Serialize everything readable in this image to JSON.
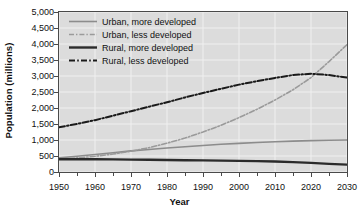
{
  "chart_data": {
    "type": "line",
    "title": "",
    "xlabel": "Year",
    "ylabel": "Population (millions)",
    "xlim": [
      1950,
      2030
    ],
    "ylim": [
      0,
      5000
    ],
    "ytick_step": 500,
    "xtick_step": 10,
    "xminor_step": 5,
    "grid": true,
    "legend_position": "top-left",
    "xticks": [
      "1950",
      "1960",
      "1970",
      "1980",
      "1990",
      "2000",
      "2010",
      "2020",
      "2030"
    ],
    "yticks": [
      "0",
      "500",
      "1,000",
      "1,500",
      "2,000",
      "2,500",
      "3,000",
      "3,500",
      "4,000",
      "4,500",
      "5,000"
    ],
    "x": [
      1950,
      1955,
      1960,
      1965,
      1970,
      1975,
      1980,
      1985,
      1990,
      1995,
      2000,
      2005,
      2010,
      2015,
      2020,
      2025,
      2030
    ],
    "series": [
      {
        "name": "Urban, more developed",
        "style": "solid",
        "color": "#8c8c8c",
        "width": 1.6,
        "values": [
          440,
          490,
          545,
          600,
          660,
          705,
          750,
          790,
          830,
          865,
          895,
          920,
          945,
          965,
          980,
          992,
          1000
        ]
      },
      {
        "name": "Urban, less developed",
        "style": "dashdot",
        "color": "#9a9a9a",
        "width": 1.6,
        "values": [
          400,
          440,
          490,
          560,
          650,
          760,
          900,
          1060,
          1250,
          1460,
          1700,
          1960,
          2250,
          2570,
          2950,
          3450,
          3980
        ]
      },
      {
        "name": "Rural, more developed",
        "style": "solid",
        "color": "#2b2b2b",
        "width": 2.4,
        "values": [
          400,
          400,
          398,
          393,
          388,
          382,
          375,
          368,
          362,
          355,
          348,
          340,
          330,
          310,
          285,
          255,
          230
        ]
      },
      {
        "name": "Rural, less developed",
        "style": "dashdot",
        "color": "#1a1a1a",
        "width": 2.0,
        "values": [
          1400,
          1500,
          1620,
          1760,
          1900,
          2040,
          2180,
          2330,
          2470,
          2600,
          2730,
          2840,
          2940,
          3030,
          3070,
          3030,
          2950
        ]
      }
    ]
  },
  "legend": {
    "items": [
      {
        "label": "Urban, more developed"
      },
      {
        "label": "Urban, less developed"
      },
      {
        "label": "Rural, more developed"
      },
      {
        "label": "Rural, less developed"
      }
    ]
  },
  "axes": {
    "x_title": "Year",
    "y_title": "Population (millions)"
  },
  "colors": {
    "plot_background": "#dcdcdc",
    "page_background": "#ffffff",
    "gridline": "#f0f0f0",
    "axis": "#4a4a4a",
    "text": "#111111"
  }
}
